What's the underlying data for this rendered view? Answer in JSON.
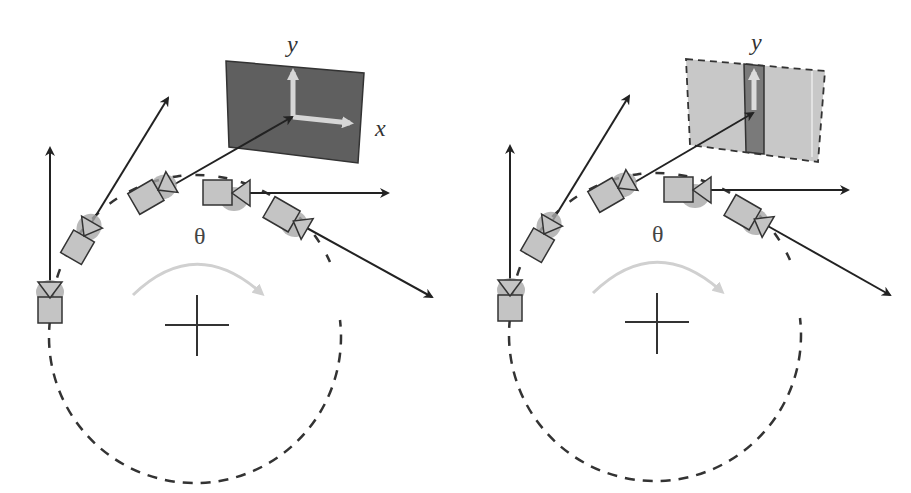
{
  "panels": [
    {
      "id": "left",
      "description": "Cameras on circular path observing a textured plane with 2D (x,y) structure",
      "labels": {
        "y_axis": "y",
        "x_axis": "x",
        "angle": "θ"
      },
      "plane_style": "solid-dark",
      "colors": {
        "plane_fill": "#5f5f5f",
        "axis_arrows": "#cfcfcf",
        "camera_fill": "#bdbdbd",
        "rotation_arrow": "#d0d0d0"
      }
    },
    {
      "id": "right",
      "description": "Cameras on circular path observing a plane with only a vertical (y) stripe",
      "labels": {
        "y_axis": "y",
        "angle": "θ"
      },
      "plane_style": "dashed-light-with-stripe",
      "colors": {
        "plane_fill": "#c8c8c8",
        "stripe_fill": "#7a7a7a",
        "axis_arrows": "#d9d9d9",
        "camera_fill": "#bdbdbd",
        "rotation_arrow": "#d0d0d0"
      }
    }
  ],
  "icons": {
    "camera": "camera-icon",
    "center": "crosshair-icon",
    "rotation": "curved-arrow-icon"
  }
}
